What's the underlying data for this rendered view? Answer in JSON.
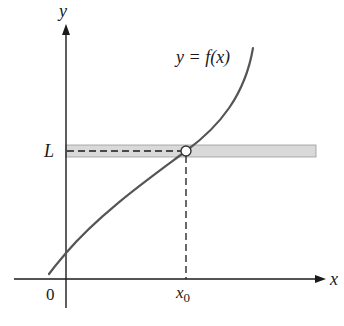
{
  "figure": {
    "type": "function-graph",
    "axes": {
      "x_label": "x",
      "y_label": "y",
      "origin_label": "0"
    },
    "curve": {
      "label": "y = f(x)",
      "color": "#555555"
    },
    "level": {
      "label": "L",
      "band_color": "#d9d9d9"
    },
    "point": {
      "x_label": "x",
      "x_subscript": "0",
      "style": "open-circle"
    }
  }
}
